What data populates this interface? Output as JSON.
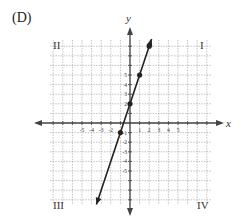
{
  "choice_label": "(D)",
  "axes": {
    "x_label": "x",
    "y_label": "y",
    "x_tick_labels": [
      "-5",
      "-4",
      "-3",
      "-2",
      "1",
      "2",
      "3",
      "4",
      "5"
    ],
    "x_tick_values": [
      -5,
      -4,
      -3,
      -2,
      1,
      2,
      3,
      4,
      5
    ],
    "y_tick_labels": [
      "5",
      "4",
      "3",
      "2",
      "-1",
      "-2",
      "-3",
      "-4",
      "-5"
    ],
    "y_tick_values": [
      5,
      4,
      3,
      2,
      -1,
      -2,
      -3,
      -4,
      -5
    ]
  },
  "quadrants": {
    "q1": "I",
    "q2": "II",
    "q3": "III",
    "q4": "IV"
  },
  "colors": {
    "grid": "#9a9a9a",
    "axis": "#444444",
    "line": "#222222",
    "text": "#333333"
  },
  "chart_data": {
    "type": "line",
    "title": "(D)",
    "xlabel": "x",
    "ylabel": "y",
    "equation": "y = 3x + 2",
    "points": [
      {
        "x": -1,
        "y": -1
      },
      {
        "x": 0,
        "y": 2
      },
      {
        "x": 1,
        "y": 5
      },
      {
        "x": 2,
        "y": 8
      }
    ],
    "xlim": [
      -8,
      8
    ],
    "ylim": [
      -8,
      8
    ],
    "grid": true,
    "quadrant_labels": [
      "I",
      "II",
      "III",
      "IV"
    ]
  }
}
